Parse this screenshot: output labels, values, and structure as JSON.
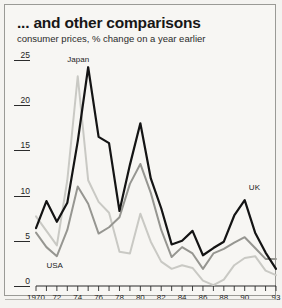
{
  "header": {
    "title": "... and other comparisons",
    "subtitle": "consumer prices, % change on a year earlier"
  },
  "chart_data": {
    "type": "line",
    "title": "... and other comparisons",
    "subtitle": "consumer prices, % change on a year earlier",
    "xlabel": "",
    "ylabel": "",
    "ylim": [
      0,
      25
    ],
    "xlim": [
      1970,
      1993
    ],
    "grid": false,
    "legend": "inline-labels",
    "y_ticks": [
      "0",
      "5",
      "10",
      "15",
      "20",
      "25"
    ],
    "y_tick_values": [
      0,
      5,
      10,
      15,
      20,
      25
    ],
    "x_ticks": [
      "1970",
      "72",
      "74",
      "76",
      "78",
      "80",
      "82",
      "84",
      "86",
      "88",
      "90",
      "93"
    ],
    "x_tick_values": [
      1970,
      1972,
      1974,
      1976,
      1978,
      1980,
      1982,
      1984,
      1986,
      1988,
      1990,
      1993
    ],
    "x": [
      1970,
      1971,
      1972,
      1973,
      1974,
      1975,
      1976,
      1977,
      1978,
      1979,
      1980,
      1981,
      1982,
      1983,
      1984,
      1985,
      1986,
      1987,
      1988,
      1989,
      1990,
      1991,
      1992,
      1993
    ],
    "series": [
      {
        "name": "UK",
        "color": "#141414",
        "values": [
          6.4,
          9.4,
          7.1,
          9.2,
          16.0,
          24.2,
          16.5,
          15.8,
          8.3,
          13.4,
          18.0,
          11.9,
          8.6,
          4.6,
          5.0,
          6.1,
          3.4,
          4.2,
          4.9,
          7.8,
          9.5,
          5.9,
          3.7,
          1.9
        ]
      },
      {
        "name": "USA",
        "color": "#969691",
        "values": [
          5.9,
          4.3,
          3.3,
          6.2,
          11.0,
          9.1,
          5.8,
          6.5,
          7.6,
          11.3,
          13.5,
          10.3,
          6.2,
          3.2,
          4.3,
          3.6,
          1.9,
          3.6,
          4.1,
          4.8,
          5.4,
          4.2,
          3.0,
          3.0
        ]
      },
      {
        "name": "Japan",
        "color": "#c9c9c4",
        "values": [
          7.7,
          6.1,
          4.5,
          11.7,
          23.2,
          11.7,
          9.3,
          8.1,
          3.8,
          3.6,
          8.0,
          4.9,
          2.7,
          1.9,
          2.3,
          2.0,
          0.6,
          0.1,
          0.7,
          2.3,
          3.1,
          3.3,
          1.7,
          1.2
        ]
      }
    ],
    "annotations": [
      {
        "text": "Japan",
        "series": "Japan",
        "x": 1973,
        "y": 25.0
      },
      {
        "text": "USA",
        "series": "USA",
        "x": 1971,
        "y": 2.2
      },
      {
        "text": "UK",
        "series": "UK",
        "x": 1990.4,
        "y": 10.8
      }
    ]
  }
}
